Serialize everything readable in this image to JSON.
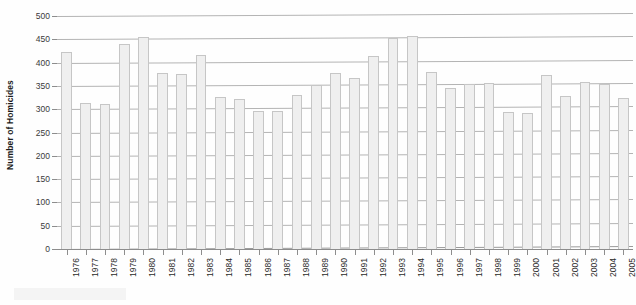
{
  "chart_data": {
    "type": "bar",
    "title": "",
    "subtitle": "",
    "xlabel": "",
    "ylabel": "Number of Homicides",
    "ylim": [
      0,
      500
    ],
    "ytick_step": 50,
    "yticks": [
      500,
      450,
      400,
      350,
      300,
      250,
      200,
      150,
      100,
      50,
      0
    ],
    "ytick_labels": [
      "500",
      "450",
      "400",
      "350",
      "300",
      "250",
      "200",
      "150",
      "100",
      "50",
      "0"
    ],
    "grid": true,
    "grid_axis": "y",
    "legend": false,
    "legend_position": "none",
    "categories": [
      "1976",
      "1977",
      "1978",
      "1979",
      "1980",
      "1981",
      "1982",
      "1983",
      "1984",
      "1985",
      "1986",
      "1987",
      "1988",
      "1989",
      "1990",
      "1991",
      "1992",
      "1993",
      "1994",
      "1995",
      "1996",
      "1997",
      "1998",
      "1999",
      "2000",
      "2001",
      "2002",
      "2003",
      "2004",
      "2005"
    ],
    "values": [
      422,
      313,
      312,
      441,
      456,
      378,
      375,
      416,
      326,
      321,
      297,
      297,
      331,
      353,
      377,
      366,
      414,
      452,
      458,
      379,
      345,
      354,
      357,
      294,
      292,
      373,
      328,
      358,
      355,
      325
    ],
    "bar_fill_color": "#efefef",
    "bar_border_color": "#c6c6c6",
    "gridline_color": "#b4b4b4",
    "axis_color": "#8d8d8d",
    "text_color": "#2a2a2a",
    "background_color": "#fefefe"
  }
}
